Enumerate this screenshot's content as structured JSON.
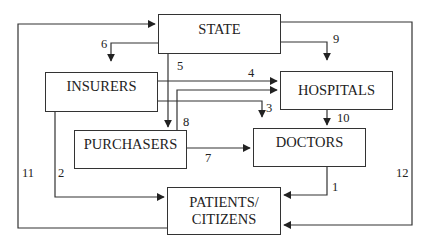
{
  "diagram": {
    "type": "flow",
    "nodes": [
      {
        "id": "state",
        "label": "STATE"
      },
      {
        "id": "insurers",
        "label": "INSURERS"
      },
      {
        "id": "hospitals",
        "label": "HOSPITALS"
      },
      {
        "id": "purchasers",
        "label": "PURCHASERS"
      },
      {
        "id": "doctors",
        "label": "DOCTORS"
      },
      {
        "id": "patients",
        "label_line1": "PATIENTS/",
        "label_line2": "CITIZENS"
      }
    ],
    "edges": [
      {
        "id": "1",
        "label": "1",
        "from": "doctors",
        "to": "patients"
      },
      {
        "id": "2",
        "label": "2",
        "from": "insurers",
        "to": "patients"
      },
      {
        "id": "3",
        "label": "3",
        "from": "insurers",
        "to": "doctors"
      },
      {
        "id": "4",
        "label": "4",
        "from": "insurers",
        "to": "hospitals"
      },
      {
        "id": "5",
        "label": "5",
        "from": "state",
        "to": "purchasers"
      },
      {
        "id": "6",
        "label": "6",
        "from": "state",
        "to": "insurers"
      },
      {
        "id": "7",
        "label": "7",
        "from": "purchasers",
        "to": "doctors"
      },
      {
        "id": "8",
        "label": "8",
        "from": "purchasers",
        "to": "hospitals"
      },
      {
        "id": "9",
        "label": "9",
        "from": "state",
        "to": "hospitals"
      },
      {
        "id": "10",
        "label": "10",
        "from": "hospitals",
        "to": "doctors"
      },
      {
        "id": "11",
        "label": "11",
        "from": "patients",
        "to": "state"
      },
      {
        "id": "12",
        "label": "12",
        "from": "state",
        "to": "patients"
      }
    ]
  }
}
